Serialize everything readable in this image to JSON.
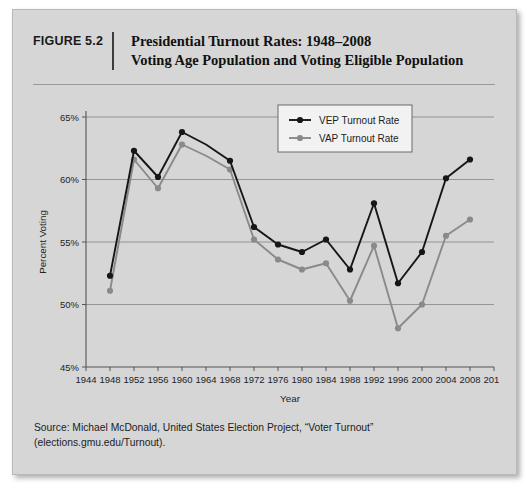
{
  "figure": {
    "label": "FIGURE 5.2",
    "title_line1": "Presidential Turnout Rates: 1948–2008",
    "title_line2": "Voting Age Population and Voting Eligible Population",
    "source": "Source: Michael McDonald, United States Election Project, “Voter Turnout” (elections.gmu.edu/Turnout)."
  },
  "colors": {
    "card_background": "#d6d6d6",
    "vep_series": "#161616",
    "vap_series": "#8a8a8a",
    "gridline": "#8d8d8d",
    "axis": "#555555"
  },
  "chart_data": {
    "type": "line",
    "title": "Presidential Turnout Rates: 1948–2008",
    "xlabel": "Year",
    "ylabel": "Percent Voting",
    "xlim": [
      1944,
      2012
    ],
    "ylim": [
      45,
      65
    ],
    "xticks": [
      1944,
      1948,
      1952,
      1956,
      1960,
      1964,
      1968,
      1972,
      1976,
      1980,
      1984,
      1988,
      1992,
      1996,
      2000,
      2004,
      2008,
      2012
    ],
    "yticks": [
      45,
      50,
      55,
      60,
      65
    ],
    "ytick_labels": [
      "45%",
      "50%",
      "55%",
      "60%",
      "65%"
    ],
    "grid": true,
    "legend_position": "upper right",
    "x": [
      1948,
      1952,
      1956,
      1960,
      1964,
      1968,
      1972,
      1976,
      1980,
      1984,
      1988,
      1992,
      1996,
      2000,
      2004,
      2008
    ],
    "series": [
      {
        "name": "VEP Turnout Rate",
        "color": "#161616",
        "values": [
          52.3,
          62.3,
          60.2,
          63.8,
          62.8,
          61.5,
          56.2,
          54.8,
          54.2,
          55.2,
          52.8,
          58.1,
          51.7,
          54.2,
          60.1,
          61.6
        ]
      },
      {
        "name": "VAP Turnout Rate",
        "color": "#8a8a8a",
        "values": [
          51.1,
          61.6,
          59.3,
          62.8,
          61.9,
          60.8,
          55.2,
          53.6,
          52.8,
          53.3,
          50.3,
          54.7,
          48.1,
          50.0,
          55.5,
          56.8
        ]
      }
    ]
  }
}
